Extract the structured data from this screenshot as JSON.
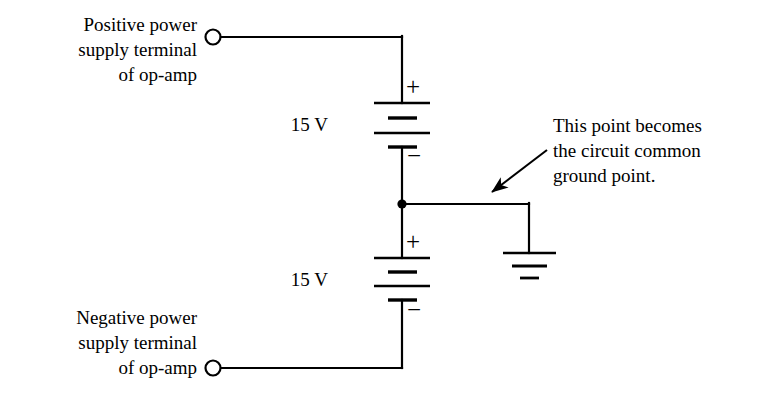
{
  "labels": {
    "positive_terminal": {
      "line1": "Positive power",
      "line2": "supply terminal",
      "line3": "of op-amp"
    },
    "negative_terminal": {
      "line1": "Negative power",
      "line2": "supply terminal",
      "line3": "of op-amp"
    },
    "annotation": {
      "line1": "This point becomes",
      "line2": "the circuit common",
      "line3": "ground point."
    }
  },
  "components": {
    "battery_top": {
      "value": "15 V",
      "plus_sign": "+",
      "minus_sign": "−"
    },
    "battery_bottom": {
      "value": "15 V",
      "plus_sign": "+",
      "minus_sign": "−"
    },
    "ground": {
      "name": "circuit common ground"
    },
    "junction": {
      "name": "common node"
    },
    "terminal_top": {
      "name": "positive supply terminal"
    },
    "terminal_bottom": {
      "name": "negative supply terminal"
    }
  },
  "style": {
    "line_color": "#000000",
    "background": "#ffffff",
    "text_color": "#000000"
  }
}
